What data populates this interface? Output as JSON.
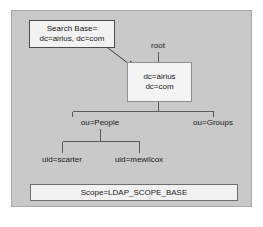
{
  "diagram": {
    "title_hidden": "LDAP directory tree with search base and scope",
    "colors": {
      "panel_fill": "#c9c9c9",
      "panel_border": "#a8a8a8",
      "box_fill": "#f2f2f2",
      "box_border": "#4a4a4a",
      "text": "#1a1a1a",
      "wire": "#5a5a5a",
      "page_background": "#ffffff"
    },
    "callout": {
      "line1": "Search Base=",
      "line2": "dc=airius, dc=com",
      "arrow_icon": "arrow-pointer-icon"
    },
    "root_label": "root",
    "root_entry": {
      "line1": "dc=airius",
      "line2": "dc=com"
    },
    "branches": [
      {
        "id": "people",
        "label": "ou=People"
      },
      {
        "id": "groups",
        "label": "ou=Groups"
      }
    ],
    "leaves": [
      {
        "id": "scarter",
        "label": "uid=scarter"
      },
      {
        "id": "mewilcox",
        "label": "uid=mewilcox"
      }
    ],
    "scope": "Scope=LDAP_SCOPE_BASE"
  }
}
